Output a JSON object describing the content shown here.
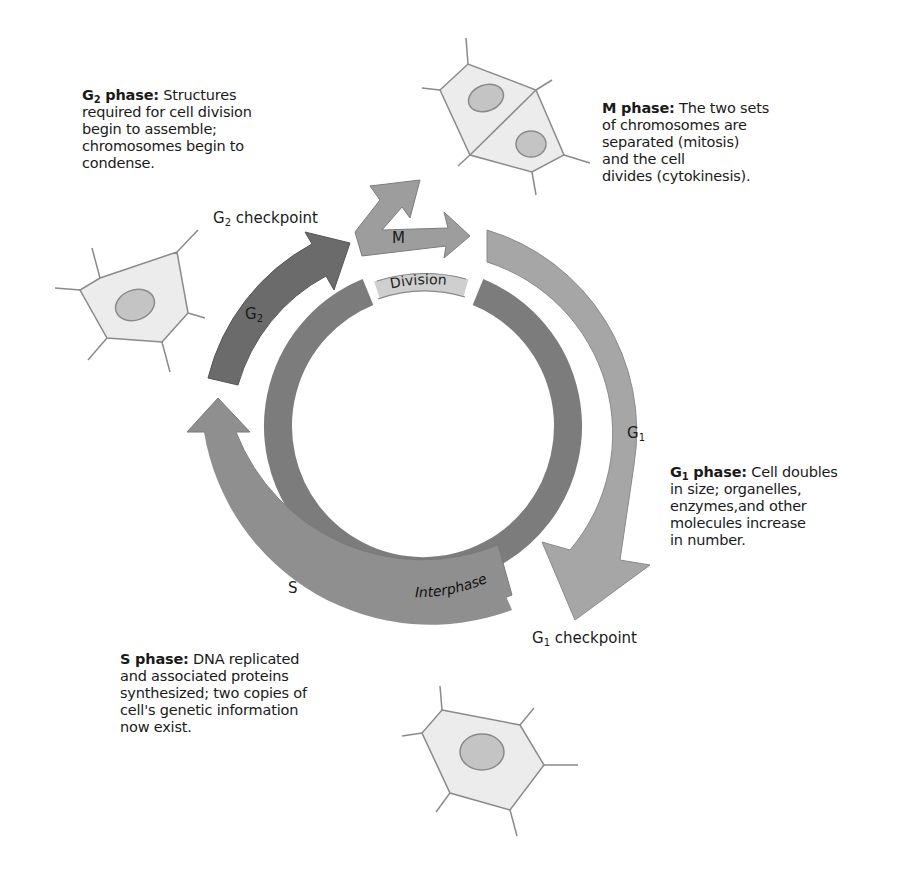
{
  "descriptions": {
    "g2": {
      "title_letter": "G",
      "title_sub": "2",
      "title_rest": " phase:",
      "lines": [
        "Structures",
        "required for cell division",
        "begin to assemble;",
        "chromosomes begin to",
        "condense."
      ]
    },
    "m": {
      "title": "M phase:",
      "lines": [
        "The two sets",
        "of chromosomes are",
        "separated (mitosis)",
        "and the cell",
        "divides (cytokinesis)."
      ]
    },
    "g1": {
      "title_letter": "G",
      "title_sub": "1",
      "title_rest": " phase:",
      "lines": [
        "Cell doubles",
        "in size; organelles,",
        "enzymes,and other",
        "molecules increase",
        "in number."
      ]
    },
    "s": {
      "title": "S phase:",
      "lines": [
        "DNA replicated",
        "and associated proteins",
        "synthesized; two copies of",
        "cell's genetic information",
        "now exist."
      ]
    }
  },
  "cycle_labels": {
    "g2_checkpoint": {
      "letter": "G",
      "sub": "2",
      "rest": " checkpoint"
    },
    "g1_checkpoint": {
      "letter": "G",
      "sub": "1",
      "rest": " checkpoint"
    },
    "m": "M",
    "g2": {
      "letter": "G",
      "sub": "2"
    },
    "g1": {
      "letter": "G",
      "sub": "1"
    },
    "s": "S",
    "division": "Division",
    "interphase": "Interphase"
  },
  "colors": {
    "g1_arrow": "#a6a6a6",
    "s_arrow": "#8f8f8f",
    "g2_arrow": "#6b6b6b",
    "m_arrow": "#9d9d9d",
    "inner_ring": "#7c7c7c",
    "division_band": "#cfcfcf",
    "cell_fill": "#ececec",
    "cell_outline": "#8a8a8a",
    "nucleus_fill": "#c4c4c4"
  }
}
